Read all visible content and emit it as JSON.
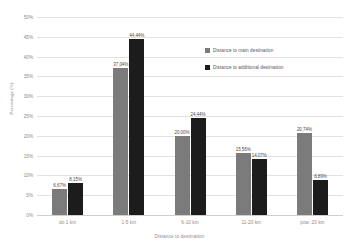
{
  "chart_data": {
    "type": "bar",
    "title": "",
    "subtitle": "",
    "xlabel": "Distance to destination",
    "ylabel": "Percentage (%)",
    "categories": [
      "do 1 km",
      "1-5 km",
      "6-10 km",
      "11-20 km",
      "pow. 20 km"
    ],
    "series": [
      {
        "name": "Distance to main destination",
        "color": "#7b7b7b",
        "values": [
          6.67,
          37.04,
          20.0,
          15.56,
          20.74
        ],
        "labels": [
          "6,67%",
          "37,04%",
          "20,00%",
          "15,56%",
          "20,74%"
        ]
      },
      {
        "name": "Distance to additional destination",
        "color": "#1c1c1c",
        "values": [
          8.15,
          44.44,
          24.44,
          14.07,
          8.89
        ],
        "labels": [
          "8,15%",
          "44,44%",
          "24,44%",
          "14,07%",
          "8,89%"
        ]
      }
    ],
    "ylim": [
      0,
      50
    ],
    "ytick_step": 5,
    "yticks": [
      "0%",
      "5%",
      "10%",
      "15%",
      "20%",
      "25%",
      "30%",
      "35%",
      "40%",
      "45%",
      "50%"
    ],
    "grid": true,
    "legend_position": "inside-upper-right",
    "value_labels_shown": true
  },
  "legend": {
    "entries": [
      {
        "label": "Distance to main destination"
      },
      {
        "label": "Distance to additional destination"
      }
    ]
  }
}
